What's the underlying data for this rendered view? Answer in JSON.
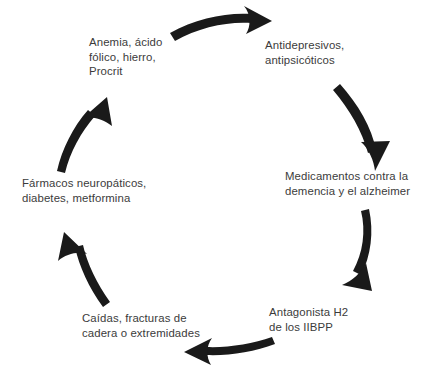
{
  "diagram": {
    "type": "cycle",
    "background_color": "#ffffff",
    "text_color": "#3b3b3b",
    "arrow_color": "#1a1a1a",
    "node_count": 6,
    "arrow_count": 6,
    "direction": "clockwise",
    "nodes": [
      {
        "id": "anemia",
        "position": "top-left",
        "text": "Anemia, ácido\nfólico, hierro,\nProcrit",
        "lines": [
          "Anemia, ácido",
          "fólico, hierro,",
          "Procrit"
        ],
        "align": "left"
      },
      {
        "id": "antidepresivos",
        "position": "top-right",
        "text": "Antidepresivos,\nantipsicóticos",
        "lines": [
          "Antidepresivos,",
          "antipsicóticos"
        ],
        "align": "left"
      },
      {
        "id": "demencia",
        "position": "right",
        "text": "Medicamentos contra la\ndemencia y el alzheimer",
        "lines": [
          "Medicamentos contra la",
          "demencia y el alzheimer"
        ],
        "align": "left"
      },
      {
        "id": "antagonista",
        "position": "bottom-right",
        "text": "Antagonista H2\nde los IIBPP",
        "lines": [
          "Antagonista H2",
          "de los IIBPP"
        ],
        "align": "left"
      },
      {
        "id": "caidas",
        "position": "bottom-left",
        "text": "Caídas, fracturas de\ncadera o extremidades",
        "lines": [
          "Caídas, fracturas de",
          "cadera o extremidades"
        ],
        "align": "left"
      },
      {
        "id": "farmacos",
        "position": "left",
        "text": "Fármacos neuropáticos,\ndiabetes, metformina",
        "lines": [
          "Fármacos neuropáticos,",
          "diabetes, metformina"
        ],
        "align": "left"
      }
    ],
    "arrows": [
      {
        "id": "arrow-anemia-to-antidepresivos",
        "from": "anemia",
        "to": "antidepresivos",
        "points_toward": "right"
      },
      {
        "id": "arrow-antidepresivos-to-demencia",
        "from": "antidepresivos",
        "to": "demencia",
        "points_toward": "down"
      },
      {
        "id": "arrow-demencia-to-antagonista",
        "from": "demencia",
        "to": "antagonista",
        "points_toward": "down-left"
      },
      {
        "id": "arrow-antagonista-to-caidas",
        "from": "antagonista",
        "to": "caidas",
        "points_toward": "left"
      },
      {
        "id": "arrow-caidas-to-farmacos",
        "from": "caidas",
        "to": "farmacos",
        "points_toward": "up-left"
      },
      {
        "id": "arrow-farmacos-to-anemia",
        "from": "farmacos",
        "to": "anemia",
        "points_toward": "up-right"
      }
    ]
  }
}
